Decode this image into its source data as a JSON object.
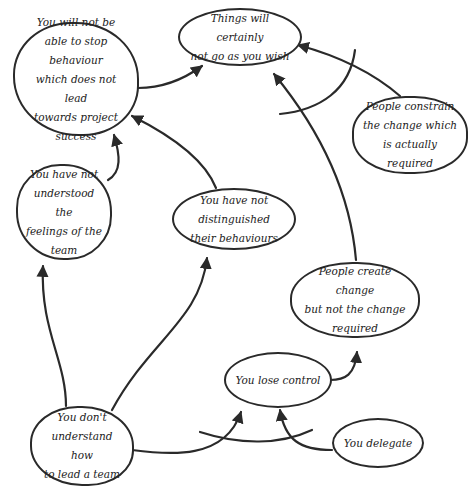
{
  "diagram": {
    "type": "cause-and-effect",
    "line_color": "#2a2a2a",
    "background": "#ffffff",
    "nodes": {
      "things_wont_go": {
        "label": "Things will certainly\nnot go as you wish"
      },
      "cannot_stop": {
        "label": "You will not be\nable to stop behaviour\nwhich does not lead\ntowards project success"
      },
      "constrain_change": {
        "label": "People constrain\nthe change which\nis actually required"
      },
      "not_understood_feelings": {
        "label": "You have not\nunderstood the\nfeelings of the\nteam"
      },
      "not_distinguished": {
        "label": "You have not distinguished\ntheir behaviours"
      },
      "create_change": {
        "label": "People create change\nbut not the change\nrequired"
      },
      "lose_control": {
        "label": "You lose control"
      },
      "dont_understand_lead": {
        "label": "You don't\nunderstand how\nto lead a team"
      },
      "delegate": {
        "label": "You delegate"
      }
    },
    "edges": [
      {
        "from": "cannot_stop",
        "to": "things_wont_go"
      },
      {
        "from": "constrain_change",
        "to": "things_wont_go"
      },
      {
        "from": "create_change",
        "to": "things_wont_go"
      },
      {
        "from": "not_understood_feelings",
        "to": "cannot_stop"
      },
      {
        "from": "not_distinguished",
        "to": "cannot_stop"
      },
      {
        "from": "dont_understand_lead",
        "to": "not_understood_feelings"
      },
      {
        "from": "dont_understand_lead",
        "to": "not_distinguished"
      },
      {
        "from": "dont_understand_lead",
        "to": "lose_control"
      },
      {
        "from": "delegate",
        "to": "lose_control"
      },
      {
        "from": "lose_control",
        "to": "create_change"
      }
    ],
    "crossing_lines": [
      {
        "description": "curved line crossing arrow from constrain_change to things_wont_go"
      },
      {
        "description": "curved line crossing arrows into lose_control"
      }
    ]
  }
}
